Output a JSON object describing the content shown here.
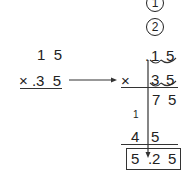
{
  "steps": {
    "step1": "1",
    "step2": "2"
  },
  "left_problem": {
    "multiplicand": "1  5",
    "multiplier": "× .3  5"
  },
  "right_problem": {
    "multiplicand_decimal": ".",
    "multiplicand_digits": [
      "1",
      "5"
    ],
    "times_sign": "×",
    "multiplier_digits": [
      "3",
      "5"
    ],
    "partial_product_1": [
      "7",
      "5"
    ],
    "carry": "1",
    "partial_product_2": [
      "4",
      "5"
    ],
    "result": [
      "5",
      ".",
      "2",
      "5"
    ]
  },
  "colors": {
    "ink": "#222222",
    "background": "#ffffff"
  }
}
